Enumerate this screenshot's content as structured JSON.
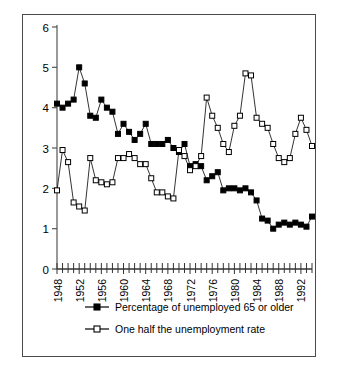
{
  "figure": {
    "caption_partial": "",
    "frame_color": "#4a4a4a",
    "background": "#ffffff"
  },
  "legend": {
    "items": [
      {
        "label": "Percentage of unemployed 65 or older",
        "marker": "filled-square",
        "color": "#000000"
      },
      {
        "label": "One half the unemployment rate",
        "marker": "open-square",
        "color": "#000000"
      }
    ]
  },
  "chart_data": {
    "type": "line",
    "title": "",
    "xlabel": "",
    "ylabel": "",
    "xlim": [
      1948,
      1994
    ],
    "ylim": [
      0,
      6
    ],
    "ytick_labels": [
      "0",
      "1",
      "2",
      "3",
      "4",
      "5",
      "6"
    ],
    "yticks": [
      0,
      1,
      2,
      3,
      4,
      5,
      6
    ],
    "xtick_labels": [
      "1948",
      "1952",
      "1956",
      "1960",
      "1964",
      "1968",
      "1972",
      "1976",
      "1980",
      "1984",
      "1988",
      "1992"
    ],
    "xticks_labeled": [
      1948,
      1952,
      1956,
      1960,
      1964,
      1968,
      1972,
      1976,
      1980,
      1984,
      1988,
      1992
    ],
    "minor_tick_interval": 1,
    "grid": false,
    "legend_position": "below-axes",
    "x": [
      1948,
      1949,
      1950,
      1951,
      1952,
      1953,
      1954,
      1955,
      1956,
      1957,
      1958,
      1959,
      1960,
      1961,
      1962,
      1963,
      1964,
      1965,
      1966,
      1967,
      1968,
      1969,
      1970,
      1971,
      1972,
      1973,
      1974,
      1975,
      1976,
      1977,
      1978,
      1979,
      1980,
      1981,
      1982,
      1983,
      1984,
      1985,
      1986,
      1987,
      1988,
      1989,
      1990,
      1991,
      1992,
      1993,
      1994
    ],
    "series": [
      {
        "name": "Percentage of unemployed 65 or older",
        "marker": "filled-square",
        "values": [
          4.1,
          4.0,
          4.1,
          4.2,
          5.0,
          4.6,
          3.8,
          3.75,
          4.2,
          4.0,
          3.9,
          3.35,
          3.6,
          3.4,
          3.2,
          3.35,
          3.6,
          3.1,
          3.1,
          3.1,
          3.2,
          3.0,
          2.9,
          3.1,
          2.55,
          2.6,
          2.55,
          2.2,
          2.3,
          2.4,
          1.95,
          2.0,
          2.0,
          1.95,
          2.0,
          1.9,
          1.7,
          1.25,
          1.2,
          1.0,
          1.1,
          1.15,
          1.1,
          1.15,
          1.1,
          1.05,
          1.3
        ]
      },
      {
        "name": "One half the unemployment rate",
        "marker": "open-square",
        "values": [
          1.95,
          2.95,
          2.65,
          1.65,
          1.55,
          1.45,
          2.75,
          2.2,
          2.15,
          2.1,
          2.15,
          2.75,
          2.75,
          2.85,
          2.75,
          2.6,
          2.6,
          2.25,
          1.9,
          1.9,
          1.8,
          1.75,
          2.95,
          2.8,
          2.45,
          2.55,
          2.8,
          4.25,
          3.8,
          3.5,
          3.1,
          2.9,
          3.55,
          3.8,
          4.85,
          4.8,
          3.75,
          3.6,
          3.5,
          3.1,
          2.75,
          2.65,
          2.75,
          3.35,
          3.75,
          3.45,
          3.05
        ]
      }
    ],
    "series_extra": {
      "note_unemployed65_tail": [
        1.45,
        1.5,
        1.35,
        1.2,
        2.05
      ],
      "note_halfrate_tail": [
        2.8
      ]
    }
  }
}
